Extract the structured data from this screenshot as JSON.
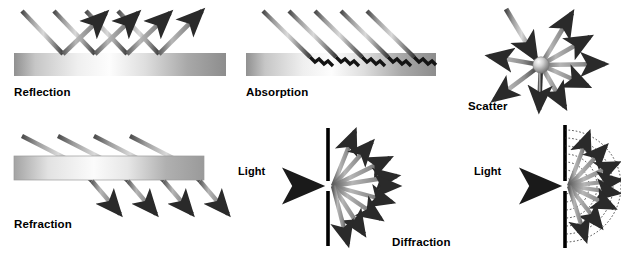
{
  "figure": {
    "background": "#ffffff",
    "width": 621,
    "height": 257
  },
  "colors": {
    "ink": "#000000",
    "ray_dark": "#3a3a3a",
    "ray_mid": "#8e8e8e",
    "ray_light": "#d8d8d8",
    "slab_dark": "#8a8a8a",
    "slab_light": "#fbfbfb",
    "barrier": "#000000",
    "wavefront": "#2b2b2b"
  },
  "panels": [
    {
      "id": "reflection",
      "label": "Reflection",
      "label_x": 14,
      "label_y": 86,
      "phenomenon": "specular reflection",
      "incident_rays": 4,
      "reflected_rays": 4,
      "surface": "flat gradient slab",
      "slab": {
        "x": 14,
        "y": 53,
        "w": 212,
        "h": 23
      }
    },
    {
      "id": "absorption",
      "label": "Absorption",
      "label_x": 246,
      "label_y": 86,
      "phenomenon": "absorption inside medium",
      "incident_rays": 5,
      "ray_termination": "jagged zigzag tail inside slab",
      "slab": {
        "x": 246,
        "y": 53,
        "w": 190,
        "h": 23
      }
    },
    {
      "id": "scatter",
      "label": "Scatter",
      "label_x": 468,
      "label_y": 100,
      "phenomenon": "scattering from particle",
      "incident_rays": 1,
      "scattered_rays": 8,
      "particle": {
        "cx": 541,
        "cy": 65,
        "r": 8
      }
    },
    {
      "id": "refraction",
      "label": "Refraction",
      "label_x": 14,
      "label_y": 218,
      "phenomenon": "refraction through slab",
      "rays": 4,
      "slab": {
        "x": 14,
        "y": 156,
        "w": 190,
        "h": 24
      }
    },
    {
      "id": "diffraction",
      "label": "Diffraction",
      "label_x": 392,
      "label_y": 236,
      "source_label": "Light",
      "source_label_x": 238,
      "source_label_y": 165,
      "phenomenon": "single-slit diffraction",
      "diffracted_rays": 9,
      "barrier_x": 328,
      "slit_y": 186
    },
    {
      "id": "diffraction-wavefronts",
      "label": "",
      "source_label": "Light",
      "source_label_x": 474,
      "source_label_y": 165,
      "phenomenon": "single-slit diffraction with circular wavefronts",
      "diffracted_rays": 9,
      "wavefront_arcs": 7,
      "barrier_x": 565,
      "slit_y": 186
    }
  ]
}
